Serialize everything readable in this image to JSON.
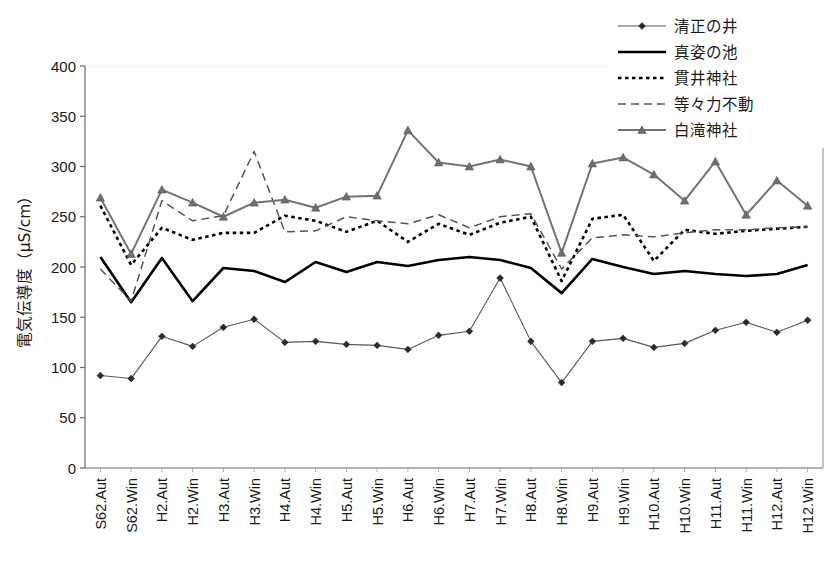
{
  "chart_data": {
    "type": "line",
    "title": "",
    "xlabel": "",
    "ylabel": "電気伝導度（μS/cm）",
    "ylim": [
      0,
      400
    ],
    "yticks": [
      0,
      50,
      100,
      150,
      200,
      250,
      300,
      350,
      400
    ],
    "grid": false,
    "legend_position": "top-right",
    "categories": [
      "S62.Aut",
      "S62.Win",
      "H2.Aut",
      "H2.Win",
      "H3.Aut",
      "H3.Win",
      "H4.Aut",
      "H4.Win",
      "H5.Aut",
      "H5.Win",
      "H6.Aut",
      "H6.Win",
      "H7.Aut",
      "H7.Win",
      "H8.Aut",
      "H8.Win",
      "H9.Aut",
      "H9.Win",
      "H10.Aut",
      "H10.Win",
      "H11.Aut",
      "H11.Win",
      "H12.Aut",
      "H12.Win"
    ],
    "series": [
      {
        "name": "清正の井",
        "style": "solid-thin-diamond",
        "color": "#595959",
        "marker": "diamond",
        "values": [
          92,
          89,
          131,
          121,
          140,
          148,
          125,
          126,
          123,
          122,
          118,
          132,
          136,
          189,
          126,
          85,
          126,
          129,
          120,
          124,
          137,
          145,
          135,
          147
        ]
      },
      {
        "name": "真姿の池",
        "style": "solid-thick",
        "color": "#000000",
        "marker": "none",
        "values": [
          210,
          165,
          209,
          166,
          199,
          196,
          185,
          205,
          195,
          205,
          201,
          207,
          210,
          207,
          199,
          174,
          208,
          200,
          193,
          196,
          193,
          191,
          193,
          202
        ]
      },
      {
        "name": "貫井神社",
        "style": "dotted",
        "color": "#000000",
        "marker": "none",
        "values": [
          261,
          202,
          239,
          227,
          234,
          234,
          251,
          246,
          235,
          246,
          225,
          243,
          232,
          244,
          250,
          186,
          248,
          252,
          206,
          237,
          233,
          236,
          238,
          240
        ]
      },
      {
        "name": "等々力不動",
        "style": "dashed",
        "color": "#555555",
        "marker": "none",
        "values": [
          198,
          166,
          266,
          246,
          251,
          315,
          235,
          236,
          250,
          246,
          243,
          252,
          239,
          250,
          253,
          198,
          229,
          232,
          230,
          234,
          237,
          237,
          239,
          240
        ]
      },
      {
        "name": "白滝神社",
        "style": "solid-thick-triangle",
        "color": "#737373",
        "marker": "triangle",
        "values": [
          269,
          213,
          277,
          264,
          250,
          264,
          267,
          259,
          270,
          271,
          336,
          304,
          300,
          307,
          300,
          214,
          303,
          309,
          292,
          266,
          305,
          252,
          286,
          261
        ]
      }
    ]
  },
  "legend": {
    "items": [
      {
        "label": "清正の井"
      },
      {
        "label": "真姿の池"
      },
      {
        "label": "貫井神社"
      },
      {
        "label": "等々力不動"
      },
      {
        "label": "白滝神社"
      }
    ]
  },
  "axes": {
    "y_title": "電気伝導度（μS/cm）",
    "y_tick_labels": [
      "400",
      "350",
      "300",
      "250",
      "200",
      "150",
      "100",
      "50",
      "0"
    ]
  }
}
